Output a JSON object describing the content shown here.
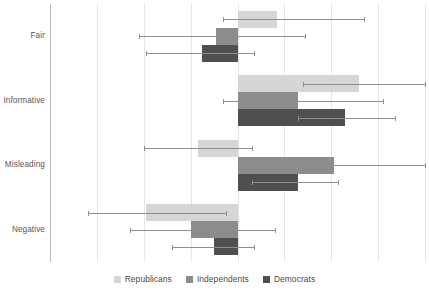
{
  "chart_data": {
    "type": "bar",
    "orientation": "horizontal",
    "title": "",
    "subtitle": "",
    "xlabel": "",
    "ylabel": "",
    "grid": true,
    "legend_position": "bottom",
    "xlim": [
      -4,
      4
    ],
    "xticks": [
      -4,
      -3,
      -2,
      -1,
      0,
      1,
      2,
      3,
      4
    ],
    "xtick_labels": [
      "",
      "",
      "",
      "",
      "",
      "",
      "",
      "",
      ""
    ],
    "zero_line": 0,
    "categories": [
      "Fair",
      "Informative",
      "Misleading",
      "Negative"
    ],
    "series": [
      {
        "name": "Republicans",
        "color": "#d6d6d6",
        "values": [
          0.85,
          2.6,
          -0.85,
          -1.95
        ],
        "errors_low": [
          -0.3,
          1.4,
          -2.0,
          -3.2
        ],
        "errors_high": [
          2.7,
          4.0,
          0.3,
          -0.25
        ]
      },
      {
        "name": "Independents",
        "color": "#8c8c8c",
        "values": [
          -0.45,
          1.3,
          2.05,
          -1.0
        ],
        "errors_low": [
          -2.1,
          -0.3,
          0.7,
          -2.3
        ],
        "errors_high": [
          1.45,
          3.1,
          4.0,
          0.8
        ]
      },
      {
        "name": "Democrats",
        "color": "#4f4f4f",
        "values": [
          -0.75,
          2.3,
          1.3,
          -0.5
        ],
        "errors_low": [
          -1.95,
          1.3,
          0.3,
          -1.4
        ],
        "errors_high": [
          0.35,
          3.35,
          2.15,
          0.35
        ]
      }
    ]
  },
  "yaxis": {
    "labels": [
      "Fair",
      "Informative",
      "Misleading",
      "Negative"
    ]
  },
  "legend": {
    "items": [
      {
        "label": "Republicans",
        "color": "#d6d6d6"
      },
      {
        "label": "Independents",
        "color": "#8c8c8c"
      },
      {
        "label": "Democrats",
        "color": "#4f4f4f"
      }
    ]
  },
  "colors": {
    "republicans": "#d6d6d6",
    "independents": "#8c8c8c",
    "democrats": "#4f4f4f",
    "grid": "#e6e6e6",
    "axis": "#b8b8b8",
    "error": "#8f8f8f",
    "text": "#4a4a4a",
    "background": "#ffffff"
  }
}
